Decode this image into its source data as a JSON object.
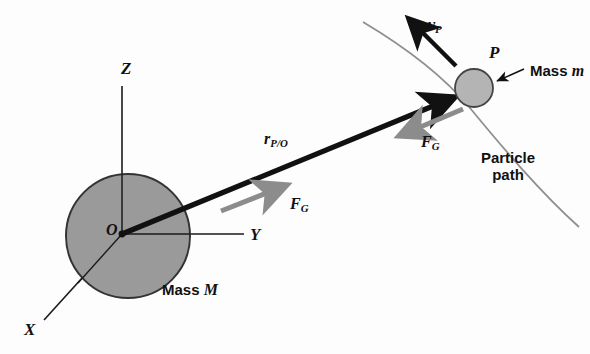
{
  "figure": {
    "background_color": "#fdfdfd"
  },
  "colors": {
    "stroke_black": "#111111",
    "sphere_fill": "#9a9a9a",
    "sphere_stroke": "#333333",
    "particle_fill": "#b4b4b4",
    "particle_stroke": "#444444",
    "force_arrow_gray": "#8c8c8c",
    "path_gray": "#8f8f8f",
    "axis_black": "#1a1a1a"
  },
  "axes": {
    "z": {
      "label": "Z"
    },
    "y": {
      "label": "Y"
    },
    "x": {
      "label": "X"
    }
  },
  "origin": {
    "label": "O"
  },
  "bodies": {
    "central": {
      "mass_label_prefix": "Mass",
      "mass_label_symbol": "M"
    },
    "particle": {
      "point_label": "P",
      "mass_label_prefix": "Mass",
      "mass_label_symbol": "m"
    }
  },
  "vectors": {
    "position": {
      "symbol": "r",
      "subscript": "P/O"
    },
    "velocity": {
      "symbol": "v",
      "subscript": "P"
    },
    "force_on_particle": {
      "symbol": "F",
      "subscript": "G"
    },
    "force_on_central": {
      "symbol": "F",
      "subscript": "G"
    }
  },
  "annotations": {
    "particle_path_line1": "Particle",
    "particle_path_line2": "path"
  }
}
